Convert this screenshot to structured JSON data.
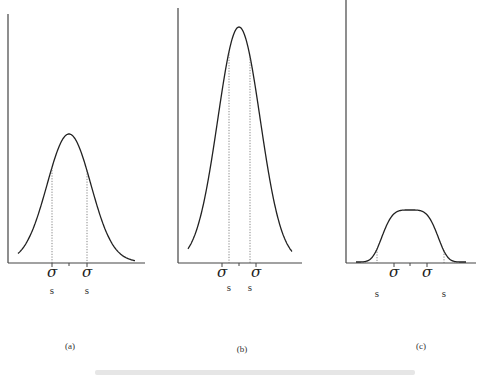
{
  "figure": {
    "panels": [
      {
        "id": "a",
        "label": "(a)",
        "description": "Normal-width bell curve; s coincides with sigma",
        "sigma_symbol": "σ",
        "s_symbol": "s",
        "axis": {
          "x0": 8,
          "y_top": 14,
          "y_base": 263,
          "x_end": 145
        },
        "curve": {
          "center": 69,
          "peak_y": 135,
          "sigma_left": 52,
          "sigma_right": 87
        },
        "s_positions": [
          52,
          87
        ],
        "sigma_positions": [
          52,
          87
        ],
        "label_pos": {
          "x": 70,
          "y": 341
        }
      },
      {
        "id": "b",
        "label": "(b)",
        "description": "Narrow tall curve; s lies inside sigma",
        "sigma_symbol": "σ",
        "s_symbol": "s",
        "axis": {
          "x0": 178,
          "y_top": 8,
          "y_base": 263,
          "x_end": 302
        },
        "curve": {
          "center": 239,
          "peak_y": 28,
          "sigma_left": 222,
          "sigma_right": 256
        },
        "s_positions": [
          229,
          250
        ],
        "sigma_positions": [
          222,
          256
        ],
        "label_pos": {
          "x": 242,
          "y": 344
        }
      },
      {
        "id": "c",
        "label": "(c)",
        "description": "Flat wide curve; s lies outside sigma",
        "sigma_symbol": "σ",
        "s_symbol": "s",
        "axis": {
          "x0": 346,
          "y_top": 0,
          "y_base": 263,
          "x_end": 476
        },
        "curve": {
          "center": 410,
          "peak_y": 211,
          "sigma_left": 394,
          "sigma_right": 427
        },
        "s_positions": [
          377,
          444
        ],
        "sigma_positions": [
          394,
          427
        ],
        "label_pos": {
          "x": 421,
          "y": 341
        }
      }
    ],
    "caption": ""
  }
}
